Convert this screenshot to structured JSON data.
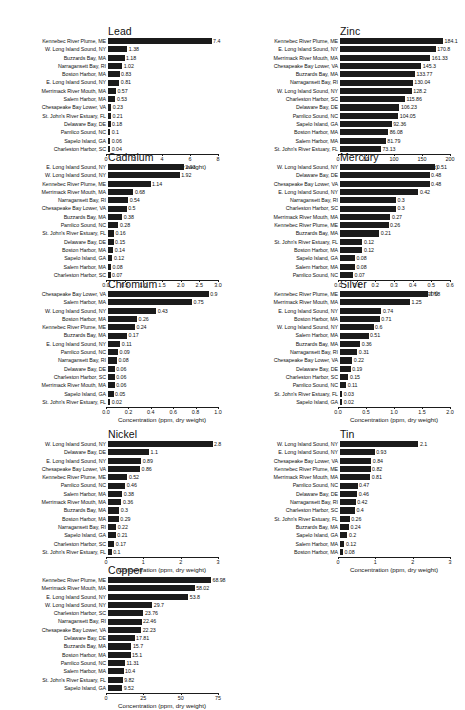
{
  "figure": {
    "axis_title": "Concentration (ppm, dry weight)",
    "bar_color": "#1b1b1b",
    "background": "#ffffff"
  },
  "chart_data": [
    {
      "type": "bar",
      "title": "Lead",
      "orientation": "horizontal",
      "xlabel": "Concentration (ppm, dry weight)",
      "ylabel": "",
      "xlim": [
        0,
        8
      ],
      "xticks": [
        0,
        2,
        4,
        6,
        8
      ],
      "xticklabels": [
        "0",
        "2",
        "4",
        "6",
        "8"
      ],
      "grid": false,
      "legend": "none",
      "categories": [
        "Kennebec River Plume, ME",
        "W. Long Island Sound, NY",
        "Buzzards Bay, MA",
        "Narragansett Bay, RI",
        "Boston Harbor, MA",
        "E. Long Island Sound, NY",
        "Merrimack River Mouth, MA",
        "Salem Harbor, MA",
        "Chesapeake Bay Lower, VA",
        "St. John's River Estuary, FL",
        "Delaware Bay, DE",
        "Pamlico Sound, NC",
        "Sapelo Island, GA",
        "Charleston Harbor, SC"
      ],
      "values": [
        7.4,
        1.38,
        1.18,
        1.02,
        0.83,
        0.81,
        0.57,
        0.53,
        0.23,
        0.21,
        0.18,
        0.1,
        0.06,
        0.04
      ],
      "value_labels": [
        "7.4",
        "1.38",
        "1.18",
        "1.02",
        "0.83",
        "0.81",
        "0.57",
        "0.53",
        "0.23",
        "0.21",
        "0.18",
        "0.1",
        "0.06",
        "0.04"
      ]
    },
    {
      "type": "bar",
      "title": "Zinc",
      "orientation": "horizontal",
      "xlabel": "Concentration (ppm, dry weight)",
      "ylabel": "",
      "xlim": [
        0,
        200
      ],
      "xticks": [
        0,
        50,
        100,
        150,
        200
      ],
      "xticklabels": [
        "0",
        "50",
        "100",
        "150",
        "200"
      ],
      "grid": false,
      "legend": "none",
      "categories": [
        "Kennebec River Plume, ME",
        "E. Long Island Sound, NY",
        "Merrimack River Mouth, MA",
        "Chesapeake Bay Lower, VA",
        "Buzzards Bay, MA",
        "Narragansett Bay, RI",
        "W. Long Island Sound, NY",
        "Charleston Harbor, SC",
        "Delaware Bay, DE",
        "Pamlico Sound, NC",
        "Sapelo Island, GA",
        "Boston Harbor, MA",
        "Salem Harbor, MA",
        "St. John's River Estuary, FL"
      ],
      "values": [
        184.1,
        170.8,
        161.33,
        145.3,
        133.77,
        130.04,
        128.2,
        115.86,
        106.23,
        104.05,
        92.36,
        86.08,
        81.79,
        73.13
      ],
      "value_labels": [
        "184.1",
        "170.8",
        "161.33",
        "145.3",
        "133.77",
        "130.04",
        "128.2",
        "115.86",
        "106.23",
        "104.05",
        "92.36",
        "86.08",
        "81.79",
        "73.13"
      ]
    },
    {
      "type": "bar",
      "title": "Cadmium",
      "orientation": "horizontal",
      "xlabel": "Concentration (ppm, dry weight)",
      "ylabel": "",
      "xlim": [
        0,
        3.0
      ],
      "xticks": [
        0,
        0.5,
        1.0,
        1.5,
        2.0,
        2.5,
        3.0
      ],
      "xticklabels": [
        "0.0",
        "0.5",
        "1.0",
        "1.5",
        "2.0",
        "2.5",
        "3.0"
      ],
      "grid": false,
      "legend": "none",
      "categories": [
        "E. Long Island Sound, NY",
        "W. Long Island Sound, NY",
        "Kennebec River Plume, ME",
        "Merrimack River Mouth, MA",
        "Narragansett Bay, RI",
        "Chesapeake Bay Lower, VA",
        "Buzzards Bay, MA",
        "Pamlico Sound, NC",
        "St. John's River Estuary, FL",
        "Delaware Bay, DE",
        "Boston Harbor, MA",
        "Sapelo Island, GA",
        "Salem Harbor, MA",
        "Charleston Harbor, SC"
      ],
      "values": [
        2.03,
        1.92,
        1.14,
        0.68,
        0.54,
        0.5,
        0.38,
        0.28,
        0.16,
        0.15,
        0.14,
        0.12,
        0.08,
        0.07
      ],
      "value_labels": [
        "2.03",
        "1.92",
        "1.14",
        "0.68",
        "0.54",
        "0.5",
        "0.38",
        "0.28",
        "0.16",
        "0.15",
        "0.14",
        "0.12",
        "0.08",
        "0.07"
      ]
    },
    {
      "type": "bar",
      "title": "Mercury",
      "orientation": "horizontal",
      "xlabel": "Concentration (ppm, dry weight)",
      "ylabel": "",
      "xlim": [
        0,
        0.6
      ],
      "xticks": [
        0,
        0.1,
        0.2,
        0.3,
        0.4,
        0.5,
        0.6
      ],
      "xticklabels": [
        "0.0",
        "0.1",
        "0.2",
        "0.3",
        "0.4",
        "0.5",
        "0.6"
      ],
      "grid": false,
      "legend": "none",
      "categories": [
        "W. Long Island Sound, NY",
        "Delaware Bay, DE",
        "Chesapeake Bay Lower, VA",
        "E. Long Island Sound, NY",
        "Narragansett Bay, RI",
        "Charleston Harbor, SC",
        "Merrimack River Mouth, MA",
        "Kennebec River Plume, ME",
        "Buzzards Bay, MA",
        "St. John's River Estuary, FL",
        "Boston Harbor, MA",
        "Sapelo Island, GA",
        "Salem Harbor, MA",
        "Pamlico Sound, NC"
      ],
      "values": [
        0.51,
        0.48,
        0.48,
        0.42,
        0.3,
        0.3,
        0.27,
        0.26,
        0.21,
        0.12,
        0.12,
        0.08,
        0.08,
        0.07
      ],
      "value_labels": [
        "0.51",
        "0.48",
        "0.48",
        "0.42",
        "0.3",
        "0.3",
        "0.27",
        "0.26",
        "0.21",
        "0.12",
        "0.12",
        "0.08",
        "0.08",
        "0.07"
      ]
    },
    {
      "type": "bar",
      "title": "Chromium",
      "orientation": "horizontal",
      "xlabel": "Concentration (ppm, dry weight)",
      "ylabel": "",
      "xlim": [
        0,
        1.0
      ],
      "xticks": [
        0,
        0.2,
        0.4,
        0.6,
        0.8,
        1.0
      ],
      "xticklabels": [
        "0.0",
        "0.2",
        "0.4",
        "0.6",
        "0.8",
        "1.0"
      ],
      "grid": false,
      "legend": "none",
      "categories": [
        "Chesapeake Bay Lower, VA",
        "Salem Harbor, MA",
        "W. Long Island Sound, NY",
        "Boston Harbor, MA",
        "Kennebec River Plume, ME",
        "Buzzards Bay, MA",
        "E. Long Island Sound, NY",
        "Pamlico Sound, NC",
        "Narragansett Bay, RI",
        "Delaware Bay, DE",
        "Charleston Harbor, SC",
        "Merrimack River Mouth, MA",
        "Sapelo Island, GA",
        "St. John's River Estuary, FL"
      ],
      "values": [
        0.9,
        0.75,
        0.43,
        0.26,
        0.24,
        0.17,
        0.11,
        0.09,
        0.08,
        0.06,
        0.06,
        0.06,
        0.05,
        0.02
      ],
      "value_labels": [
        "0.9",
        "0.75",
        "0.43",
        "0.26",
        "0.24",
        "0.17",
        "0.11",
        "0.09",
        "0.08",
        "0.06",
        "0.06",
        "0.06",
        "0.05",
        "0.02"
      ]
    },
    {
      "type": "bar",
      "title": "Silver",
      "orientation": "horizontal",
      "xlabel": "Concentration (ppm, dry weight)",
      "ylabel": "",
      "xlim": [
        0,
        2.0
      ],
      "xticks": [
        0,
        0.5,
        1.0,
        1.5,
        2.0
      ],
      "xticklabels": [
        "0.0",
        "0.5",
        "1.0",
        "1.5",
        "2.0"
      ],
      "grid": false,
      "legend": "none",
      "categories": [
        "Kennebec River Plume, ME",
        "Merrimack River Mouth, MA",
        "E. Long Island Sound, NY",
        "Boston Harbor, MA",
        "W. Long Island Sound, NY",
        "Salem Harbor, MA",
        "Buzzards Bay, MA",
        "Narragansett Bay, RI",
        "Chesapeake Bay Lower, VA",
        "Delaware Bay, DE",
        "Charleston Harbor, SC",
        "Pamlico Sound, NC",
        "St. John's River Estuary, FL",
        "Sapelo Island, GA"
      ],
      "values": [
        1.58,
        1.25,
        0.74,
        0.71,
        0.6,
        0.51,
        0.36,
        0.31,
        0.22,
        0.19,
        0.15,
        0.11,
        0.03,
        0.02
      ],
      "value_labels": [
        "1.58",
        "1.25",
        "0.74",
        "0.71",
        "0.6",
        "0.51",
        "0.36",
        "0.31",
        "0.22",
        "0.19",
        "0.15",
        "0.11",
        "0.03",
        "0.02"
      ]
    },
    {
      "type": "bar",
      "title": "Nickel",
      "orientation": "horizontal",
      "xlabel": "Concentration (ppm, dry weight)",
      "ylabel": "",
      "xlim": [
        0,
        3
      ],
      "xticks": [
        0,
        1,
        2,
        3
      ],
      "xticklabels": [
        "0",
        "1",
        "2",
        "3"
      ],
      "grid": false,
      "legend": "none",
      "categories": [
        "W. Long Island Sound, NY",
        "Delaware Bay, DE",
        "E. Long Island Sound, NY",
        "Chesapeake Bay Lower, VA",
        "Kennebec River Plume, ME",
        "Pamlico Sound, NC",
        "Salem Harbor, MA",
        "Merrimack River Mouth, MA",
        "Buzzards Bay, MA",
        "Boston Harbor, MA",
        "Narragansett Bay, RI",
        "Sapelo Island, GA",
        "Charleston Harbor, SC",
        "St. John's River Estuary, FL"
      ],
      "values": [
        2.8,
        1.1,
        0.89,
        0.86,
        0.52,
        0.46,
        0.38,
        0.36,
        0.3,
        0.29,
        0.22,
        0.21,
        0.17,
        0.1
      ],
      "value_labels": [
        "2.8",
        "1.1",
        "0.89",
        "0.86",
        "0.52",
        "0.46",
        "0.38",
        "0.36",
        "0.3",
        "0.29",
        "0.22",
        "0.21",
        "0.17",
        "0.1"
      ]
    },
    {
      "type": "bar",
      "title": "Tin",
      "orientation": "horizontal",
      "xlabel": "Concentration (ppm, dry weight)",
      "ylabel": "",
      "xlim": [
        0,
        3
      ],
      "xticks": [
        0,
        1,
        2,
        3
      ],
      "xticklabels": [
        "0",
        "1",
        "2",
        "3"
      ],
      "grid": false,
      "legend": "none",
      "categories": [
        "W. Long Island Sound, NY",
        "E. Long Island Sound, NY",
        "Chesapeake Bay Lower, VA",
        "Kennebec River Plume, ME",
        "Merrimack River Mouth, MA",
        "Pamlico Sound, NC",
        "Delaware Bay, DE",
        "Narragansett Bay, RI",
        "Charleston Harbor, SC",
        "St. John's River Estuary, FL",
        "Buzzards Bay, MA",
        "Sapelo Island, GA",
        "Salem Harbor, MA",
        "Boston Harbor, MA"
      ],
      "values": [
        2.1,
        0.93,
        0.84,
        0.82,
        0.81,
        0.47,
        0.46,
        0.42,
        0.4,
        0.26,
        0.24,
        0.2,
        0.12,
        0.08
      ],
      "value_labels": [
        "2.1",
        "0.93",
        "0.84",
        "0.82",
        "0.81",
        "0.47",
        "0.46",
        "0.42",
        "0.4",
        "0.26",
        "0.24",
        "0.2",
        "0.12",
        "0.08"
      ]
    },
    {
      "type": "bar",
      "title": "Copper",
      "orientation": "horizontal",
      "xlabel": "Concentration (ppm, dry weight)",
      "ylabel": "",
      "xlim": [
        0,
        75
      ],
      "xticks": [
        0,
        25,
        50,
        75
      ],
      "xticklabels": [
        "0",
        "25",
        "50",
        "75"
      ],
      "grid": false,
      "legend": "none",
      "categories": [
        "Kennebec River Plume, ME",
        "Merrimack River Mouth, MA",
        "E. Long Island Sound, NY",
        "W. Long Island Sound, NY",
        "Charleston Harbor, SC",
        "Narragansett Bay, RI",
        "Chesapeake Bay Lower, VA",
        "Delaware Bay, DE",
        "Buzzards Bay, MA",
        "Boston Harbor, MA",
        "Pamlico Sound, NC",
        "Salem Harbor, MA",
        "St. John's River Estuary, FL",
        "Sapelo Island, GA"
      ],
      "values": [
        68.98,
        58.02,
        53.8,
        29.7,
        23.76,
        22.46,
        22.23,
        17.81,
        15.7,
        15.1,
        11.31,
        10.4,
        9.82,
        9.52
      ],
      "value_labels": [
        "68.98",
        "58.02",
        "53.8",
        "29.7",
        "23.76",
        "22.46",
        "22.23",
        "17.81",
        "15.7",
        "15.1",
        "11.31",
        "10.4",
        "9.82",
        "9.52"
      ]
    }
  ],
  "layout": [
    {
      "key": "lead",
      "left": 2,
      "top": 26,
      "labelW": 104,
      "trackW": 112,
      "titleLeft": 106
    },
    {
      "key": "zinc",
      "left": 234,
      "top": 26,
      "labelW": 104,
      "trackW": 112,
      "titleLeft": 338
    },
    {
      "key": "cadmium",
      "left": 2,
      "top": 152,
      "labelW": 104,
      "trackW": 112,
      "titleLeft": 106
    },
    {
      "key": "mercury",
      "left": 234,
      "top": 152,
      "labelW": 104,
      "trackW": 112,
      "titleLeft": 338
    },
    {
      "key": "chromium",
      "left": 2,
      "top": 279,
      "labelW": 104,
      "trackW": 112,
      "titleLeft": 106
    },
    {
      "key": "silver",
      "left": 234,
      "top": 279,
      "labelW": 104,
      "trackW": 112,
      "titleLeft": 338
    },
    {
      "key": "nickel",
      "left": 2,
      "top": 429,
      "labelW": 104,
      "trackW": 112,
      "titleLeft": 106
    },
    {
      "key": "tin",
      "left": 234,
      "top": 429,
      "labelW": 104,
      "trackW": 112,
      "titleLeft": 338
    },
    {
      "key": "copper",
      "left": 2,
      "top": 565,
      "labelW": 104,
      "trackW": 112,
      "titleLeft": 106
    }
  ]
}
